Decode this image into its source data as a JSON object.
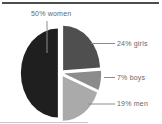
{
  "chart_data": {
    "type": "pie",
    "title": "",
    "categories": [
      "girls",
      "boys",
      "men",
      "women"
    ],
    "values": [
      24,
      7,
      19,
      50
    ],
    "start_angle_deg": 0,
    "direction": "clockwise-from-top",
    "explode": 0.085,
    "legend_position": "none (direct labels with leader lines)",
    "slices": [
      {
        "name": "girls",
        "value": 24,
        "label": "24% girls",
        "color": "#4f4f4f"
      },
      {
        "name": "boys",
        "value": 7,
        "label": "7% boys",
        "color": "#8c8c8c"
      },
      {
        "name": "men",
        "value": 19,
        "label": "19% men",
        "color": "#aaaaaa"
      },
      {
        "name": "women",
        "value": 50,
        "label": "50% women",
        "color": "#1f1f1f"
      }
    ]
  },
  "decorations": {
    "top_rule_color": "#4d4d4d",
    "bottom_rule_color": "#c9c9c9",
    "leader_line_color": "#8c8c8c",
    "label_text_color": "#666666"
  }
}
